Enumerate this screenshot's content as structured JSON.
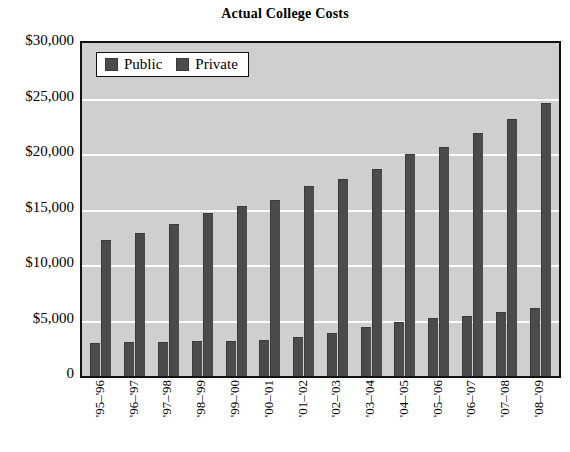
{
  "chart_data": {
    "type": "bar",
    "title": "Actual College Costs",
    "xlabel": "",
    "ylabel": "",
    "ylim": [
      0,
      30000
    ],
    "ytick_values": [
      30000,
      25000,
      20000,
      15000,
      10000,
      5000,
      0
    ],
    "ytick_labels": [
      "$30,000",
      "$25,000",
      "$20,000",
      "$15,000",
      "$10,000",
      "$5,000",
      "0"
    ],
    "grid": true,
    "legend_position": "upper-left-inside",
    "categories": [
      "'95–'96",
      "'96–'97",
      "'97–'98",
      "'98–'99",
      "'99–'00",
      "'00–'01",
      "'01–'02",
      "'02–'03",
      "'03–'04",
      "'04–'05",
      "'05–'06",
      "'06–'07",
      "'07–'08",
      "'08–'09"
    ],
    "series": [
      {
        "name": "Public",
        "color": "#4b4b4b",
        "values": [
          2900,
          2950,
          3000,
          3050,
          3100,
          3150,
          3450,
          3800,
          4300,
          4800,
          5100,
          5300,
          5650,
          6000
        ]
      },
      {
        "name": "Private",
        "color": "#4b4b4b",
        "values": [
          12200,
          12800,
          13600,
          14600,
          15200,
          15800,
          17000,
          17700,
          18600,
          19900,
          20500,
          21800,
          23100,
          24500
        ]
      }
    ]
  },
  "legend": {
    "items": [
      {
        "label": "Public",
        "swatch_name": "legend-swatch-public"
      },
      {
        "label": "Private",
        "swatch_name": "legend-swatch-private"
      }
    ]
  },
  "colors": {
    "plot_background": "#cfcfcf",
    "bar": "#4b4b4b",
    "gridline": "#fdfdfd",
    "axis": "#111111",
    "page_background": "#ffffff",
    "text": "#000000"
  }
}
